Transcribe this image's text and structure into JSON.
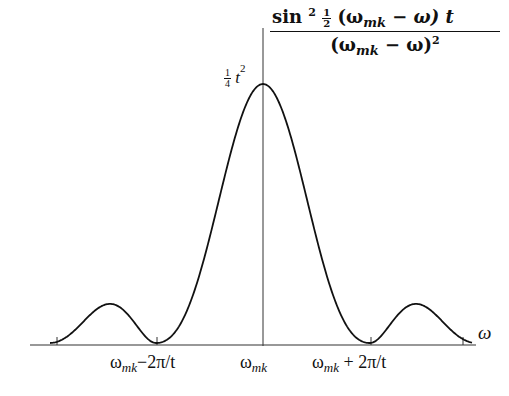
{
  "diagram": {
    "formula": {
      "numerator_prefix": "sin",
      "numerator_power": "2",
      "half_num": "1",
      "half_den": "2",
      "numerator_body_open": "(ω",
      "numerator_sub": "mk",
      "numerator_body_close": " − ω) t",
      "denominator_open": "(ω",
      "denominator_sub": "mk",
      "denominator_close": " − ω)",
      "denominator_power": "2"
    },
    "peak_label": {
      "frac_num": "1",
      "frac_den": "4",
      "var": "t",
      "power": "2"
    },
    "axis_label": "ω",
    "ticks": [
      {
        "base": "ω",
        "sub": "mk",
        "suffix": "−2π/t"
      },
      {
        "base": "ω",
        "sub": "mk",
        "suffix": ""
      },
      {
        "base": "ω",
        "sub": "mk",
        "suffix": " + 2π/t"
      }
    ],
    "colors": {
      "line": "#111111",
      "axis": "#333333",
      "background": "#ffffff"
    }
  }
}
